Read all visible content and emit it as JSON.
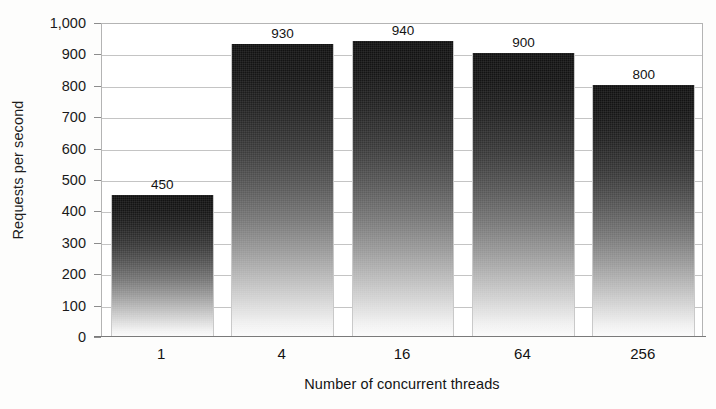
{
  "chart_data": {
    "type": "bar",
    "title": "",
    "subtitle": "",
    "xlabel": "Number of concurrent threads",
    "ylabel": "Requests per second",
    "categories": [
      "1",
      "4",
      "16",
      "64",
      "256"
    ],
    "values": [
      450,
      930,
      940,
      900,
      800
    ],
    "value_labels": [
      "450",
      "930",
      "940",
      "900",
      "800"
    ],
    "ylim": [
      0,
      1000
    ],
    "ytick_values": [
      0,
      100,
      200,
      300,
      400,
      500,
      600,
      700,
      800,
      900,
      1000
    ],
    "ytick_labels": [
      "0",
      "100",
      "200",
      "300",
      "400",
      "500",
      "600",
      "700",
      "800",
      "900",
      "1,000"
    ],
    "grid": true,
    "grid_axis": "y",
    "legend": false,
    "legend_position": "none",
    "bar_fill": "vertical-gradient-dark-to-light",
    "colors": {
      "bar_top": "#111111",
      "bar_bottom": "#fbfbfb",
      "gridline": "#c4c4c4",
      "axis": "#7a7a7a",
      "plot_border": "#b4b4b4",
      "text": "#141414",
      "background": "#fdfdfc"
    }
  }
}
